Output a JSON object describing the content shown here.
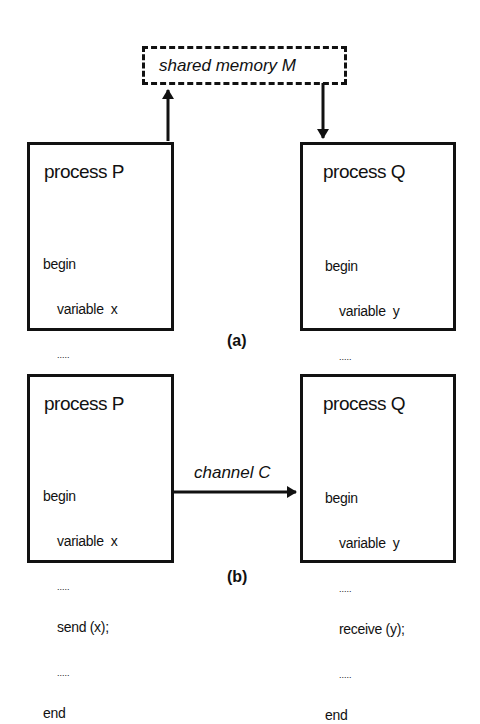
{
  "figure_a": {
    "caption": "(a)",
    "shared_memory": {
      "label": "shared memory M"
    },
    "process_p": {
      "title": "process P",
      "lines": {
        "begin": "begin",
        "decl": "variable  x",
        "dots1": ".....",
        "stmt": "M := x;",
        "dots2": ".....",
        "end": "end"
      }
    },
    "process_q": {
      "title": "process Q",
      "lines": {
        "begin": "begin",
        "decl": "variable  y",
        "dots1": ".....",
        "stmt": "y := M;",
        "dots2": ".....",
        "end": "end"
      }
    }
  },
  "figure_b": {
    "caption": "(b)",
    "channel": {
      "label": "channel C"
    },
    "process_p": {
      "title": "process P",
      "lines": {
        "begin": "begin",
        "decl": "variable  x",
        "dots1": ".....",
        "stmt": "send (x);",
        "dots2": ".....",
        "end": "end"
      }
    },
    "process_q": {
      "title": "process Q",
      "lines": {
        "begin": "begin",
        "decl": "variable  y",
        "dots1": ".....",
        "stmt": "receive (y);",
        "dots2": ".....",
        "end": "end"
      }
    }
  },
  "colors": {
    "ink": "#111111",
    "background": "#ffffff"
  }
}
